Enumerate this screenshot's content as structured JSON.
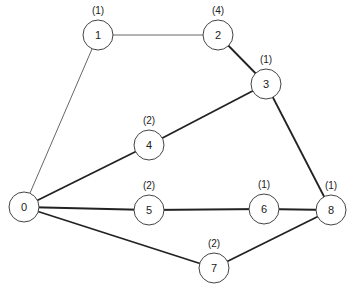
{
  "diagram": {
    "type": "weighted-graph",
    "nodes": [
      {
        "id": "0",
        "label": "0",
        "weight": "",
        "x": 24,
        "y": 207
      },
      {
        "id": "1",
        "label": "1",
        "weight": "(1)",
        "x": 98,
        "y": 35
      },
      {
        "id": "2",
        "label": "2",
        "weight": "(4)",
        "x": 218,
        "y": 35
      },
      {
        "id": "3",
        "label": "3",
        "weight": "(1)",
        "x": 266,
        "y": 84
      },
      {
        "id": "4",
        "label": "4",
        "weight": "(2)",
        "x": 149,
        "y": 145
      },
      {
        "id": "5",
        "label": "5",
        "weight": "(2)",
        "x": 149,
        "y": 210
      },
      {
        "id": "6",
        "label": "6",
        "weight": "(1)",
        "x": 264,
        "y": 209
      },
      {
        "id": "7",
        "label": "7",
        "weight": "(2)",
        "x": 214,
        "y": 268
      },
      {
        "id": "8",
        "label": "8",
        "weight": "(1)",
        "x": 331,
        "y": 210
      }
    ],
    "edges": [
      {
        "from": "0",
        "to": "1",
        "style": "thin"
      },
      {
        "from": "1",
        "to": "2",
        "style": "thin"
      },
      {
        "from": "2",
        "to": "3",
        "style": "thick"
      },
      {
        "from": "3",
        "to": "4",
        "style": "thick"
      },
      {
        "from": "4",
        "to": "0",
        "style": "thick"
      },
      {
        "from": "3",
        "to": "8",
        "style": "thick"
      },
      {
        "from": "0",
        "to": "5",
        "style": "thick"
      },
      {
        "from": "5",
        "to": "6",
        "style": "thick"
      },
      {
        "from": "6",
        "to": "8",
        "style": "thick"
      },
      {
        "from": "0",
        "to": "7",
        "style": "thick"
      },
      {
        "from": "7",
        "to": "8",
        "style": "thick"
      }
    ],
    "node_radius": 15,
    "colors": {
      "background": "#ffffff",
      "node_stroke": "#444444",
      "edge_thick": "#222222",
      "edge_thin": "#555555",
      "text": "#222222"
    }
  }
}
